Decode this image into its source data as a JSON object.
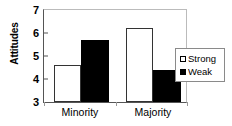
{
  "chart_data": {
    "type": "bar",
    "title": "",
    "xlabel": "",
    "ylabel": "Attitudes",
    "categories": [
      "Minority",
      "Majority"
    ],
    "series": [
      {
        "name": "Strong",
        "values": [
          4.6,
          6.2
        ],
        "color": "#ffffff"
      },
      {
        "name": "Weak",
        "values": [
          5.7,
          4.4
        ],
        "color": "#000000"
      }
    ],
    "ylim": [
      3,
      7
    ],
    "yticks": [
      3,
      4,
      5,
      6,
      7
    ],
    "ytick_labels": [
      "3",
      "4",
      "5",
      "6",
      "7"
    ],
    "grid": false,
    "legend_position": "right"
  },
  "axis": {
    "y_title": "Attitudes",
    "tick_3": "3",
    "tick_4": "4",
    "tick_5": "5",
    "tick_6": "6",
    "tick_7": "7"
  },
  "categories": {
    "minority": "Minority",
    "majority": "Majority"
  },
  "legend": {
    "strong": "Strong",
    "weak": "Weak"
  }
}
